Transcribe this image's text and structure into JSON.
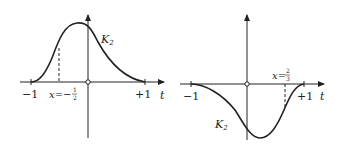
{
  "figure": {
    "panels": [
      {
        "id": "left",
        "curve_label": "K",
        "curve_subscript": "2",
        "axis_label": "t",
        "tick_minus": "−1",
        "tick_plus": "+1",
        "marker_label_prefix": "x=−",
        "marker_num": "1",
        "marker_den": "2",
        "marker_value": -0.5,
        "shape": "positive bump peaking left of origin"
      },
      {
        "id": "right",
        "curve_label": "K",
        "curve_subscript": "2",
        "axis_label": "t",
        "tick_minus": "−1",
        "tick_plus": "+1",
        "marker_label_prefix": "x=",
        "marker_num": "2",
        "marker_den": "3",
        "marker_value": 0.6667,
        "shape": "negative dip with minimum right of origin"
      }
    ],
    "colors": {
      "ink": "#222222",
      "background": "#ffffff"
    }
  }
}
